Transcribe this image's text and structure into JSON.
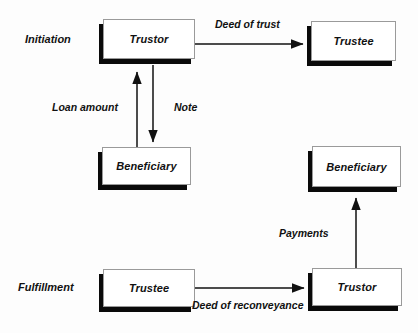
{
  "diagram": {
    "background_color": "#fdfdfd",
    "ink_color": "#111111",
    "box_fill": "#ffffff",
    "box_border": "#9a9a9a",
    "box_shadow_color": "#0a0a0a",
    "phases": [
      {
        "id": "initiation",
        "label": "Initiation"
      },
      {
        "id": "fulfillment",
        "label": "Fulfillment"
      }
    ],
    "nodes": [
      {
        "id": "trustor-top",
        "label": "Trustor"
      },
      {
        "id": "trustee-top",
        "label": "Trustee"
      },
      {
        "id": "beneficiary-mid",
        "label": "Beneficiary"
      },
      {
        "id": "beneficiary-right",
        "label": "Beneficiary"
      },
      {
        "id": "trustee-bottom",
        "label": "Trustee"
      },
      {
        "id": "trustor-bottom",
        "label": "Trustor"
      }
    ],
    "edges": [
      {
        "id": "deed-of-trust",
        "label": "Deed of trust",
        "from": "trustor-top",
        "to": "trustee-top",
        "direction": "right"
      },
      {
        "id": "loan-amount",
        "label": "Loan amount",
        "from": "beneficiary-mid",
        "to": "trustor-top",
        "direction": "up"
      },
      {
        "id": "note",
        "label": "Note",
        "from": "trustor-top",
        "to": "beneficiary-mid",
        "direction": "down"
      },
      {
        "id": "payments",
        "label": "Payments",
        "from": "trustor-bottom",
        "to": "beneficiary-right",
        "direction": "up"
      },
      {
        "id": "deed-of-reconveyance",
        "label": "Deed of reconveyance",
        "from": "trustee-bottom",
        "to": "trustor-bottom",
        "direction": "right"
      }
    ]
  }
}
